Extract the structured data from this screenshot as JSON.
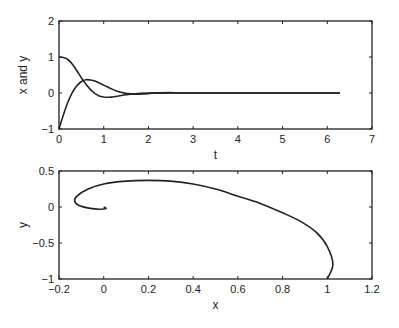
{
  "chart_data": [
    {
      "type": "line",
      "title": "",
      "xlabel": "t",
      "ylabel": "x and y",
      "xlim": [
        0,
        7
      ],
      "ylim": [
        -1,
        2
      ],
      "xticks": [
        "0",
        "1",
        "2",
        "3",
        "4",
        "5",
        "6",
        "7"
      ],
      "yticks": [
        "-1",
        "0",
        "1",
        "2"
      ],
      "grid": false,
      "legend": null,
      "series": [
        {
          "name": "x",
          "points": [
            [
              0,
              1
            ],
            [
              0.1,
              0.99
            ],
            [
              0.2,
              0.93
            ],
            [
              0.3,
              0.8
            ],
            [
              0.4,
              0.62
            ],
            [
              0.5,
              0.42
            ],
            [
              0.6,
              0.25
            ],
            [
              0.7,
              0.1
            ],
            [
              0.8,
              -0.01
            ],
            [
              0.9,
              -0.08
            ],
            [
              1.0,
              -0.11
            ],
            [
              1.1,
              -0.12
            ],
            [
              1.2,
              -0.11
            ],
            [
              1.3,
              -0.09
            ],
            [
              1.5,
              -0.05
            ],
            [
              1.7,
              -0.02
            ],
            [
              2.0,
              0.0
            ],
            [
              2.5,
              0.01
            ],
            [
              3.0,
              0.0
            ],
            [
              6.28,
              0.0
            ]
          ]
        },
        {
          "name": "y",
          "points": [
            [
              0,
              -1
            ],
            [
              0.1,
              -0.6
            ],
            [
              0.2,
              -0.25
            ],
            [
              0.3,
              0.02
            ],
            [
              0.4,
              0.2
            ],
            [
              0.5,
              0.32
            ],
            [
              0.6,
              0.37
            ],
            [
              0.7,
              0.36
            ],
            [
              0.8,
              0.33
            ],
            [
              0.9,
              0.28
            ],
            [
              1.0,
              0.22
            ],
            [
              1.1,
              0.16
            ],
            [
              1.2,
              0.1
            ],
            [
              1.3,
              0.05
            ],
            [
              1.5,
              -0.01
            ],
            [
              1.7,
              -0.03
            ],
            [
              2.0,
              -0.02
            ],
            [
              2.5,
              0.0
            ],
            [
              6.28,
              0.0
            ]
          ]
        }
      ]
    },
    {
      "type": "line",
      "title": "",
      "xlabel": "x",
      "ylabel": "y",
      "xlim": [
        -0.2,
        1.2
      ],
      "ylim": [
        -1,
        0.5
      ],
      "xticks": [
        "-0.2",
        "0",
        "0.2",
        "0.4",
        "0.6",
        "0.8",
        "1",
        "1.2"
      ],
      "yticks": [
        "-1",
        "-0.5",
        "0",
        "0.5"
      ],
      "grid": false,
      "legend": null,
      "series": [
        {
          "name": "phase trajectory",
          "points": [
            [
              1,
              -1
            ],
            [
              1.025,
              -0.8
            ],
            [
              1.0,
              -0.55
            ],
            [
              0.95,
              -0.35
            ],
            [
              0.88,
              -0.2
            ],
            [
              0.8,
              -0.08
            ],
            [
              0.7,
              0.05
            ],
            [
              0.6,
              0.15
            ],
            [
              0.5,
              0.25
            ],
            [
              0.4,
              0.32
            ],
            [
              0.3,
              0.36
            ],
            [
              0.2,
              0.37
            ],
            [
              0.1,
              0.36
            ],
            [
              0.0,
              0.32
            ],
            [
              -0.07,
              0.25
            ],
            [
              -0.12,
              0.15
            ],
            [
              -0.13,
              0.08
            ],
            [
              -0.11,
              0.02
            ],
            [
              -0.06,
              -0.02
            ],
            [
              -0.02,
              -0.03
            ],
            [
              0.01,
              -0.02
            ],
            [
              0.0,
              0.0
            ]
          ]
        }
      ]
    }
  ],
  "style": {
    "line_color": "#222222",
    "axis_color": "#222222",
    "background": "#ffffff"
  }
}
